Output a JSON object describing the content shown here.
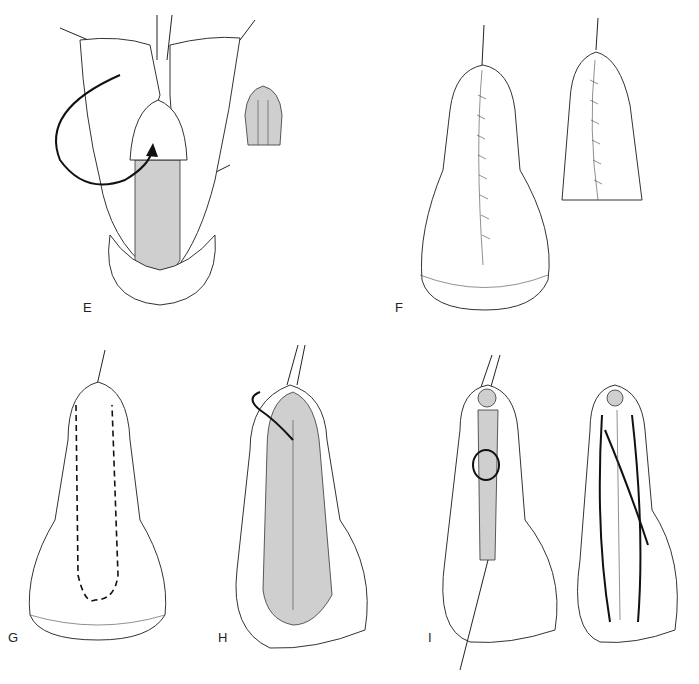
{
  "figure": {
    "panels": [
      {
        "id": "E",
        "label": "E"
      },
      {
        "id": "F",
        "label": "F"
      },
      {
        "id": "G",
        "label": "G"
      },
      {
        "id": "H",
        "label": "H"
      },
      {
        "id": "I",
        "label": "I"
      }
    ]
  }
}
